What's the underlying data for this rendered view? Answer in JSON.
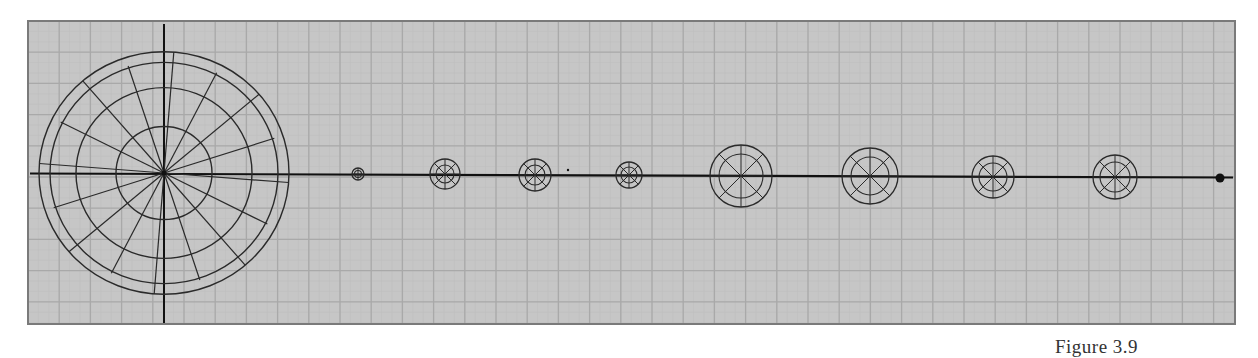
{
  "figure": {
    "caption": "Figure 3.9",
    "colors": {
      "background": "#c6c6c6",
      "grid_major": "#a9a9a9",
      "grid_minor": "#bdbdbd",
      "frame": "#7a7a7a",
      "lines": "#2a2a2a",
      "axis": "#111111"
    },
    "frame": {
      "x": 28,
      "y": 21,
      "width": 1207,
      "height": 303
    },
    "axis_y": 173.5,
    "grid_spacing": 31.2,
    "sun": {
      "name": "sun",
      "cx": 164,
      "cy": 173,
      "rings": [
        48,
        88,
        114,
        125
      ],
      "spokes": 16
    },
    "bodies": [
      {
        "name": "planet-1",
        "cx": 358,
        "cy": 174,
        "outer": 6,
        "inner": 3.5,
        "spokes": 4
      },
      {
        "name": "planet-2",
        "cx": 445,
        "cy": 174,
        "outer": 15,
        "inner": 9,
        "spokes": 8
      },
      {
        "name": "planet-3",
        "cx": 535,
        "cy": 175,
        "outer": 16,
        "inner": 10,
        "spokes": 8
      },
      {
        "name": "planet-4",
        "cx": 629,
        "cy": 175,
        "outer": 13,
        "inner": 8,
        "spokes": 8
      },
      {
        "name": "planet-5",
        "cx": 741,
        "cy": 176,
        "outer": 31,
        "inner": 22,
        "spokes": 8
      },
      {
        "name": "planet-6",
        "cx": 870,
        "cy": 176,
        "outer": 28,
        "inner": 19,
        "spokes": 8
      },
      {
        "name": "planet-7",
        "cx": 993,
        "cy": 177,
        "outer": 21,
        "inner": 14,
        "spokes": 8
      },
      {
        "name": "planet-8",
        "cx": 1115,
        "cy": 177,
        "outer": 22,
        "inner": 15,
        "spokes": 8
      }
    ],
    "markers": [
      {
        "name": "small-mark",
        "cx": 568,
        "cy": 170,
        "r": 1.2
      },
      {
        "name": "end-dot",
        "cx": 1220,
        "cy": 178,
        "r": 4.5
      }
    ]
  }
}
